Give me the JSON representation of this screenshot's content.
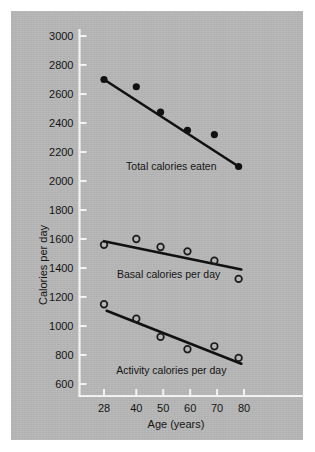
{
  "chart_data": {
    "type": "scatter",
    "title": "",
    "xlabel": "Age (years)",
    "ylabel": "Calories per day",
    "xlim": [
      22,
      86
    ],
    "ylim": [
      540,
      3080
    ],
    "grid": false,
    "legend_position": "inline-annotations",
    "xticks": [
      28,
      40,
      50,
      60,
      70,
      80
    ],
    "xtick_labels": [
      "28",
      "40",
      "50",
      "60",
      "70",
      "80"
    ],
    "yticks": [
      600,
      800,
      1000,
      1200,
      1400,
      1600,
      1800,
      2000,
      2200,
      2400,
      2600,
      2800,
      3000
    ],
    "ytick_labels": [
      "600",
      "800",
      "1000",
      "1200",
      "1400",
      "1600",
      "1800",
      "2000",
      "2200",
      "2400",
      "2600",
      "2800",
      "3000"
    ],
    "series": [
      {
        "name": "Total calories eaten",
        "marker": "filled-circle",
        "x": [
          28,
          40,
          49,
          59,
          69,
          78
        ],
        "values": [
          2700,
          2650,
          2475,
          2350,
          2320,
          2100
        ],
        "trend_line": {
          "x": [
            28,
            78
          ],
          "y": [
            2700,
            2100
          ]
        }
      },
      {
        "name": "Basal calories per day",
        "marker": "open-circle",
        "x": [
          28,
          40,
          49,
          59,
          69,
          78
        ],
        "values": [
          1560,
          1600,
          1545,
          1515,
          1450,
          1325
        ],
        "trend_line": {
          "x": [
            28,
            79
          ],
          "y": [
            1585,
            1390
          ]
        }
      },
      {
        "name": "Activity calories per day",
        "marker": "open-circle",
        "x": [
          28,
          40,
          49,
          59,
          69,
          78
        ],
        "values": [
          1150,
          1050,
          925,
          840,
          860,
          780
        ],
        "trend_line": {
          "x": [
            29,
            79
          ],
          "y": [
            1105,
            740
          ]
        }
      }
    ],
    "annotations": [
      {
        "text": "Total calories eaten",
        "x": 53,
        "y": 2075
      },
      {
        "text": "Basal calories per day",
        "x": 52,
        "y": 1330
      },
      {
        "text": "Activity calories per day",
        "x": 53,
        "y": 672
      }
    ],
    "colors": {
      "panel_background": "#b7b7b7",
      "figure_background": "#ffffff",
      "axis": "#f2f2f2",
      "ink": "#111111",
      "text": "#141414"
    }
  }
}
